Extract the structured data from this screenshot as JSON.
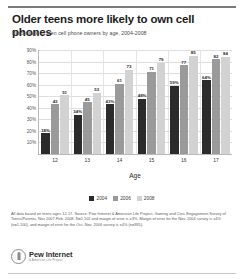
{
  "title": "Older teens more likely to own cell phones",
  "subtitle": "Percentage of teen cell phone owners by age, 2004-2008",
  "legend": {
    "items": [
      {
        "label": "2004",
        "color": "#2b2b2b"
      },
      {
        "label": "2006",
        "color": "#9a9a9a"
      },
      {
        "label": "2008",
        "color": "#d2d2d2"
      }
    ]
  },
  "footnote": "All data based on teens ages 12-17. Source: Pew Internet & American Life Project, Gaming and Civic Engagement Survey of Teens/Parents, Nov 2007-Feb. 2008. N=1,102 and margin of error is ±3%. Margin of error for the Nov. 2004 survey is ±4% (n=1,100), and margin of error for the Oct.-Nov. 2006 survey is ±4% (n=935).",
  "logo": {
    "name": "Pew Internet",
    "sub": "& American Life Project",
    "mark": "pew-logo-mark"
  },
  "chart_data": {
    "type": "bar",
    "title": "Older teens more likely to own cell phones",
    "subtitle": "Percentage of teen cell phone owners by age, 2004-2008",
    "xlabel": "Age",
    "ylabel": "",
    "categories": [
      "12",
      "13",
      "14",
      "15",
      "16",
      "17"
    ],
    "ylim": [
      0,
      90
    ],
    "yticks": [
      "10%",
      "20%",
      "30%",
      "40%",
      "50%",
      "60%",
      "70%",
      "80%",
      "90%"
    ],
    "ytick_values": [
      10,
      20,
      30,
      40,
      50,
      60,
      70,
      80,
      90
    ],
    "grid": true,
    "legend_position": "bottom",
    "series": [
      {
        "name": "2004",
        "color": "#2b2b2b",
        "values": [
          18,
          34,
          43,
          48,
          59,
          64
        ],
        "labels": [
          "18%",
          "34%",
          "43%",
          "48%",
          "59%",
          "64%"
        ]
      },
      {
        "name": "2006",
        "color": "#9a9a9a",
        "values": [
          43,
          45,
          61,
          71,
          77,
          82
        ],
        "labels": [
          "43",
          "45",
          "61",
          "71",
          "77",
          "82"
        ]
      },
      {
        "name": "2008",
        "color": "#d2d2d2",
        "values": [
          51,
          53,
          73,
          79,
          85,
          84
        ],
        "labels": [
          "51",
          "53",
          "73",
          "79",
          "85",
          "84"
        ]
      }
    ]
  }
}
